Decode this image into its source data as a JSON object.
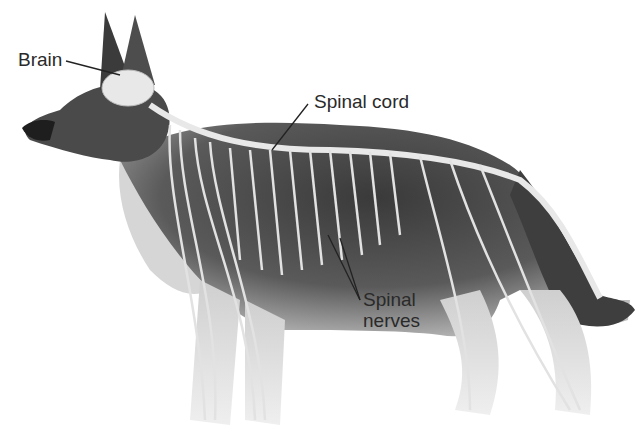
{
  "diagram": {
    "labels": {
      "brain": "Brain",
      "spinal_cord": "Spinal cord",
      "spinal_nerves_line1": "Spinal",
      "spinal_nerves_line2": "nerves"
    },
    "colors": {
      "background": "#ffffff",
      "fur_dark": "#2b2b2b",
      "fur_mid": "#6e6e6e",
      "fur_light": "#d9d9d9",
      "nerve": "#e6e6e6",
      "label_text": "#2a2a2a"
    }
  }
}
